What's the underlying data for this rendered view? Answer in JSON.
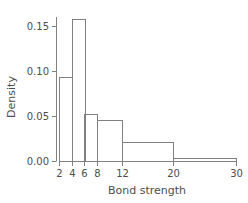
{
  "chart_data": {
    "type": "bar",
    "title": "",
    "subtitle": "",
    "xlabel": "Bond strength",
    "ylabel": "Density",
    "xlim": [
      2,
      30
    ],
    "ylim": [
      0.0,
      0.16
    ],
    "grid": false,
    "legend": null,
    "style": {
      "line_color": "#808080",
      "text_color": "#4d4d4d",
      "background": "#ffffff",
      "bar_fill": "none",
      "line_width": 1
    },
    "xticks": [
      2,
      4,
      6,
      8,
      12,
      20,
      30
    ],
    "xtick_labels": [
      "2",
      "4",
      "6",
      "8",
      "12",
      "20",
      "30"
    ],
    "yticks": [
      0.0,
      0.05,
      0.1,
      0.15
    ],
    "ytick_labels": [
      "0.00",
      "0.05",
      "0.10",
      "0.15"
    ],
    "bin_edges": [
      2,
      4,
      6,
      8,
      12,
      20,
      30
    ],
    "categories": [
      "2-4",
      "4-6",
      "6-8",
      "8-12",
      "12-20",
      "20-30"
    ],
    "values": [
      0.093,
      0.158,
      0.052,
      0.046,
      0.021,
      0.003
    ],
    "bars": [
      {
        "label": "2-4",
        "x0": 2,
        "x1": 4,
        "density": 0.093
      },
      {
        "label": "4-6",
        "x0": 4,
        "x1": 6,
        "density": 0.158
      },
      {
        "label": "6-8",
        "x0": 6,
        "x1": 8,
        "density": 0.052
      },
      {
        "label": "8-12",
        "x0": 8,
        "x1": 12,
        "density": 0.046
      },
      {
        "label": "12-20",
        "x0": 12,
        "x1": 20,
        "density": 0.021
      },
      {
        "label": "20-30",
        "x0": 20,
        "x1": 30,
        "density": 0.003
      }
    ]
  }
}
